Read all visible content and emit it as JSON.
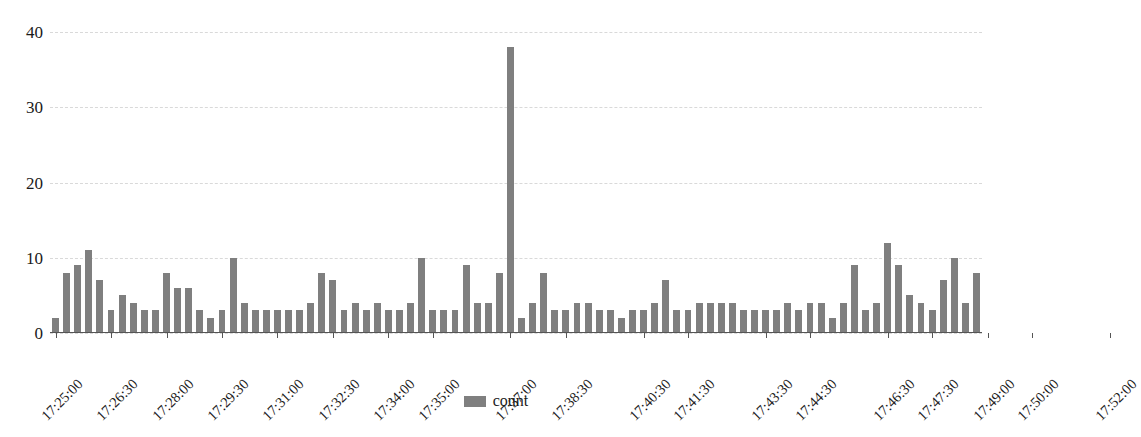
{
  "chart_data": {
    "type": "bar",
    "title": "",
    "subtitle": "",
    "xlabel": "",
    "ylabel": "",
    "ylim": [
      0,
      40
    ],
    "y_ticks": [
      0,
      10,
      20,
      30,
      40
    ],
    "grid": true,
    "legend_position": "bottom",
    "series": [
      {
        "name": "count",
        "color": "#7f7f7f",
        "values": [
          2,
          8,
          9,
          11,
          7,
          3,
          5,
          4,
          3,
          3,
          8,
          6,
          6,
          3,
          2,
          3,
          10,
          4,
          3,
          3,
          3,
          3,
          3,
          4,
          8,
          7,
          3,
          4,
          3,
          4,
          3,
          3,
          4,
          10,
          3,
          3,
          3,
          9,
          4,
          4,
          8,
          38,
          2,
          4,
          8,
          3,
          3,
          4,
          4,
          3,
          3,
          2,
          3,
          3,
          4,
          7,
          3,
          3,
          4,
          4,
          4,
          4,
          3,
          3,
          3,
          3,
          4,
          3,
          4,
          4,
          2,
          4,
          9,
          3,
          4,
          12,
          9,
          5,
          4,
          3,
          7,
          10,
          4,
          8
        ]
      }
    ],
    "x_axis": {
      "start": "17:25:00",
      "end": "17:52:00",
      "tick_labels": [
        "17:25:00",
        "17:26:30",
        "17:28:00",
        "17:29:30",
        "17:31:00",
        "17:32:30",
        "17:34:00",
        "17:35:00",
        "17:37:00",
        "17:38:30",
        "17:40:30",
        "17:41:30",
        "17:43:30",
        "17:44:30",
        "17:46:30",
        "17:47:30",
        "17:49:00",
        "17:50:00",
        "17:52:00"
      ],
      "tick_positions": [
        0,
        5,
        10,
        15,
        20,
        25,
        30,
        34,
        41,
        46,
        53,
        57,
        64,
        68,
        75,
        79,
        84,
        88,
        95
      ]
    },
    "legend": [
      {
        "label": "count",
        "color": "#7f7f7f"
      }
    ]
  }
}
